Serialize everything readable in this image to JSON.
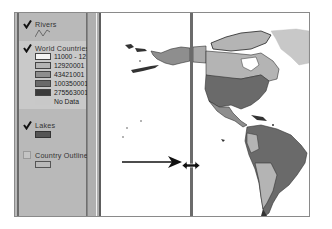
{
  "toc": {
    "layers": [
      {
        "name": "Rivers",
        "checked": true,
        "symbol": "line"
      },
      {
        "name": "World Countries",
        "checked": true,
        "symbol": "classes",
        "classes": [
          {
            "label": "11000 - 12",
            "color": "#f4f4f4"
          },
          {
            "label": "12920001",
            "color": "#b4b4b4"
          },
          {
            "label": "43421001",
            "color": "#8e8e8e"
          },
          {
            "label": "100350001",
            "color": "#6a6a6a"
          },
          {
            "label": "275563001",
            "color": "#3a3a3a"
          },
          {
            "label": "No Data",
            "color": "#c8c8c8"
          }
        ]
      },
      {
        "name": "Lakes",
        "checked": true,
        "symbol": "fill",
        "color": "#555555"
      },
      {
        "name": "Country Outlines",
        "checked": false,
        "symbol": "outline"
      }
    ]
  },
  "map": {
    "split_handle": "resize-horizontal-cursor",
    "annotation": "arrow pointing to splitter handle"
  },
  "colors": {
    "toc_bg": "#b9b9b9",
    "map_bg": "#ffffff",
    "split_line": "#6b6b6b"
  }
}
